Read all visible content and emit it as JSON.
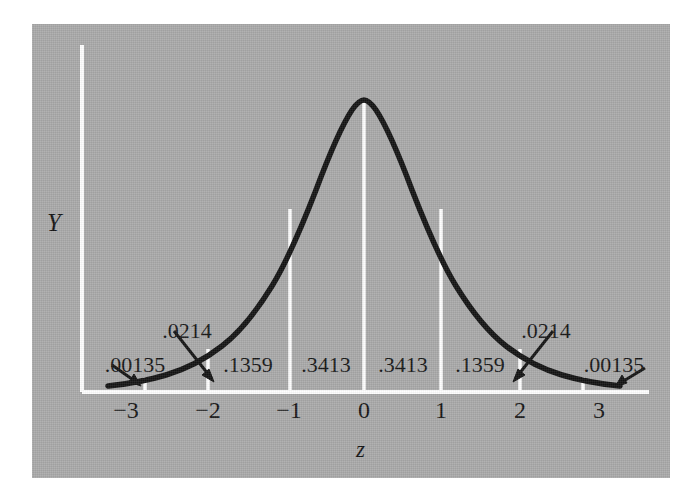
{
  "figure": {
    "y_axis_label": "Y",
    "x_axis_label": "z",
    "panel_color": "#a9a9a9",
    "curve_color": "#121212",
    "gridline_color": "#ffffff"
  },
  "chart_data": {
    "type": "line",
    "title": "",
    "subtitle": "",
    "xlabel": "z",
    "ylabel": "Y",
    "grid": true,
    "legend": null,
    "xlim": [
      -3.5,
      3.5
    ],
    "ylim": [
      0,
      0.42
    ],
    "xticks": [
      -3,
      -2,
      -1,
      0,
      1,
      2,
      3
    ],
    "xtick_labels": [
      "−3",
      "−2",
      "−1",
      "0",
      "1",
      "2",
      "3"
    ],
    "yticks": [],
    "ytick_labels": [],
    "gridline_z_values": [
      -3,
      -2,
      -1,
      0,
      1,
      2,
      3
    ],
    "bands": [
      {
        "range": [
          -3,
          -2
        ],
        "label": ".00135",
        "label_z": -3.2,
        "value": 0.00135,
        "callout": true
      },
      {
        "range": [
          -3,
          -2
        ],
        "label": ".0214",
        "label_z": -2.35,
        "value": 0.0214,
        "callout": true
      },
      {
        "range": [
          -2,
          -1
        ],
        "label": ".1359",
        "label_z": -1.5,
        "value": 0.1359,
        "callout": false
      },
      {
        "range": [
          -1,
          0
        ],
        "label": ".3413",
        "label_z": -0.5,
        "value": 0.3413,
        "callout": false
      },
      {
        "range": [
          0,
          1
        ],
        "label": ".3413",
        "label_z": 0.5,
        "value": 0.3413,
        "callout": false
      },
      {
        "range": [
          1,
          2
        ],
        "label": ".1359",
        "label_z": 1.5,
        "value": 0.1359,
        "callout": false
      },
      {
        "range": [
          2,
          3
        ],
        "label": ".0214",
        "label_z": 2.35,
        "value": 0.0214,
        "callout": true
      },
      {
        "range": [
          3,
          3.5
        ],
        "label": ".00135",
        "label_z": 3.2,
        "value": 0.00135,
        "callout": true
      }
    ],
    "curve": {
      "formula": "standard normal pdf",
      "peak_z": 0,
      "peak_density": 0.3989
    },
    "annotations": [
      {
        "text": ".00135",
        "arrow_to_z": -3.15,
        "side": "left"
      },
      {
        "text": ".0214",
        "arrow_to_z": -2.2,
        "side": "left"
      },
      {
        "text": ".0214",
        "arrow_to_z": 2.2,
        "side": "right"
      },
      {
        "text": ".00135",
        "arrow_to_z": 3.15,
        "side": "right"
      }
    ]
  },
  "ticks": [
    {
      "label": "−3",
      "x": 126
    },
    {
      "label": "−2",
      "x": 208
    },
    {
      "label": "−1",
      "x": 289
    },
    {
      "label": "0",
      "x": 364
    },
    {
      "label": "1",
      "x": 441
    },
    {
      "label": "2",
      "x": 520
    },
    {
      "label": "3",
      "x": 599
    }
  ],
  "area_labels": [
    {
      "label": ".00135",
      "x": 135,
      "y": 354
    },
    {
      "label": ".0214",
      "x": 187,
      "y": 320
    },
    {
      "label": ".1359",
      "x": 248,
      "y": 354
    },
    {
      "label": ".3413",
      "x": 326,
      "y": 354
    },
    {
      "label": ".3413",
      "x": 403,
      "y": 354
    },
    {
      "label": ".1359",
      "x": 480,
      "y": 354
    },
    {
      "label": ".0214",
      "x": 546,
      "y": 320
    },
    {
      "label": ".00135",
      "x": 614,
      "y": 354
    }
  ]
}
